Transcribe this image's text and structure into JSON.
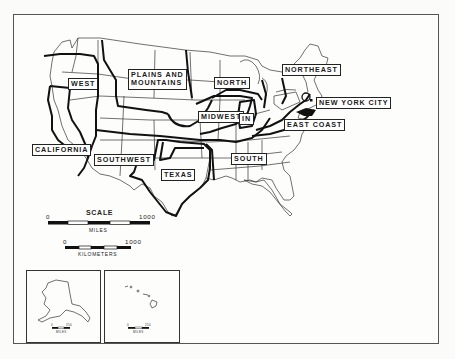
{
  "map": {
    "regions": [
      {
        "id": "west",
        "label": "WEST"
      },
      {
        "id": "plains",
        "label": "PLAINS AND\nMOUNTAINS",
        "line1": "PLAINS AND",
        "line2": "MOUNTAINS"
      },
      {
        "id": "north",
        "label": "NORTH"
      },
      {
        "id": "northeast",
        "label": "NORTHEAST"
      },
      {
        "id": "nyc",
        "label": "NEW YORK CITY"
      },
      {
        "id": "midwest",
        "label": "MIDWEST"
      },
      {
        "id": "in",
        "label": "IN"
      },
      {
        "id": "eastcoast",
        "label": "EAST COAST"
      },
      {
        "id": "california",
        "label": "CALIFORNIA"
      },
      {
        "id": "southwest",
        "label": "SOUTHWEST"
      },
      {
        "id": "south",
        "label": "SOUTH"
      },
      {
        "id": "texas",
        "label": "TEXAS"
      }
    ],
    "scale": {
      "title": "SCALE",
      "miles": {
        "start": "0",
        "end": "1000",
        "unit": "MILES"
      },
      "kilometers": {
        "start": "0",
        "end": "1000",
        "unit": "KILOMETERS"
      }
    },
    "insets": {
      "alaska": {
        "start": "0",
        "end": "250",
        "unit": "MILES"
      },
      "hawaii": {
        "start": "0",
        "end": "250",
        "unit": "MILES"
      }
    },
    "colors": {
      "ink": "#1a1a1a",
      "paper": "#fdfdfc",
      "frame": "#555555"
    }
  }
}
